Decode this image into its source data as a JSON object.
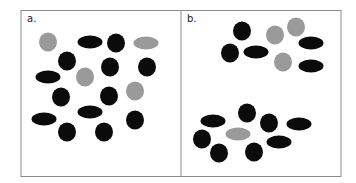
{
  "figure": {
    "colors": {
      "dark": "#0b0b0b",
      "gray": "#9a9a9a",
      "frame": "#8a8a8a",
      "background": "#ffffff"
    },
    "panels": [
      {
        "label": "a.",
        "shapes": [
          {
            "type": "circle",
            "color": "gray",
            "cx": 48,
            "cy": 42
          },
          {
            "type": "ellipse",
            "color": "dark",
            "cx": 90,
            "cy": 42
          },
          {
            "type": "circle",
            "color": "dark",
            "cx": 116,
            "cy": 43
          },
          {
            "type": "ellipse",
            "color": "gray",
            "cx": 146,
            "cy": 43
          },
          {
            "type": "circle",
            "color": "dark",
            "cx": 67,
            "cy": 61
          },
          {
            "type": "circle",
            "color": "dark",
            "cx": 110,
            "cy": 67
          },
          {
            "type": "circle",
            "color": "dark",
            "cx": 147,
            "cy": 67
          },
          {
            "type": "ellipse",
            "color": "dark",
            "cx": 48,
            "cy": 77
          },
          {
            "type": "circle",
            "color": "gray",
            "cx": 85,
            "cy": 77
          },
          {
            "type": "circle",
            "color": "dark",
            "cx": 61,
            "cy": 97
          },
          {
            "type": "circle",
            "color": "dark",
            "cx": 109,
            "cy": 96
          },
          {
            "type": "circle",
            "color": "gray",
            "cx": 135,
            "cy": 91
          },
          {
            "type": "ellipse",
            "color": "dark",
            "cx": 44,
            "cy": 119
          },
          {
            "type": "ellipse",
            "color": "dark",
            "cx": 90,
            "cy": 112
          },
          {
            "type": "circle",
            "color": "dark",
            "cx": 135,
            "cy": 120
          },
          {
            "type": "circle",
            "color": "dark",
            "cx": 67,
            "cy": 132
          },
          {
            "type": "circle",
            "color": "dark",
            "cx": 104,
            "cy": 132
          }
        ]
      },
      {
        "label": "b.",
        "shapes": [
          {
            "type": "circle",
            "color": "dark",
            "cx": 242,
            "cy": 31
          },
          {
            "type": "circle",
            "color": "gray",
            "cx": 275,
            "cy": 35
          },
          {
            "type": "circle",
            "color": "gray",
            "cx": 296,
            "cy": 27
          },
          {
            "type": "ellipse",
            "color": "dark",
            "cx": 311,
            "cy": 43
          },
          {
            "type": "circle",
            "color": "dark",
            "cx": 230,
            "cy": 53
          },
          {
            "type": "ellipse",
            "color": "dark",
            "cx": 256,
            "cy": 52
          },
          {
            "type": "circle",
            "color": "gray",
            "cx": 283,
            "cy": 62
          },
          {
            "type": "ellipse",
            "color": "dark",
            "cx": 311,
            "cy": 66
          },
          {
            "type": "circle",
            "color": "dark",
            "cx": 247,
            "cy": 113
          },
          {
            "type": "ellipse",
            "color": "dark",
            "cx": 213,
            "cy": 121
          },
          {
            "type": "circle",
            "color": "dark",
            "cx": 269,
            "cy": 123
          },
          {
            "type": "ellipse",
            "color": "dark",
            "cx": 299,
            "cy": 124
          },
          {
            "type": "ellipse",
            "color": "gray",
            "cx": 238,
            "cy": 134
          },
          {
            "type": "circle",
            "color": "dark",
            "cx": 202,
            "cy": 139
          },
          {
            "type": "ellipse",
            "color": "dark",
            "cx": 279,
            "cy": 142
          },
          {
            "type": "circle",
            "color": "dark",
            "cx": 219,
            "cy": 153
          },
          {
            "type": "circle",
            "color": "dark",
            "cx": 254,
            "cy": 152
          }
        ]
      }
    ]
  }
}
